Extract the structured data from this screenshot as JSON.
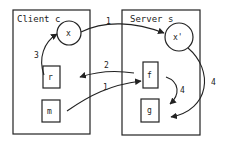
{
  "diagram": {
    "client": {
      "label": "Client c"
    },
    "server": {
      "label": "Server s"
    },
    "nodes": {
      "x": "x",
      "x_prime": "x'",
      "r": "r",
      "m": "m",
      "f": "f",
      "g": "g"
    },
    "edges": [
      {
        "from": "x",
        "to": "x'",
        "label": "1"
      },
      {
        "from": "m",
        "to": "f",
        "label": "1"
      },
      {
        "from": "f",
        "to": "r",
        "label": "2"
      },
      {
        "from": "r",
        "to": "x",
        "label": "3"
      },
      {
        "from": "f",
        "to": "g",
        "label": "4"
      },
      {
        "from": "x'",
        "to": "g",
        "label": "4"
      }
    ],
    "colors": {
      "stroke": "#222222",
      "background": "#ffffff"
    }
  }
}
